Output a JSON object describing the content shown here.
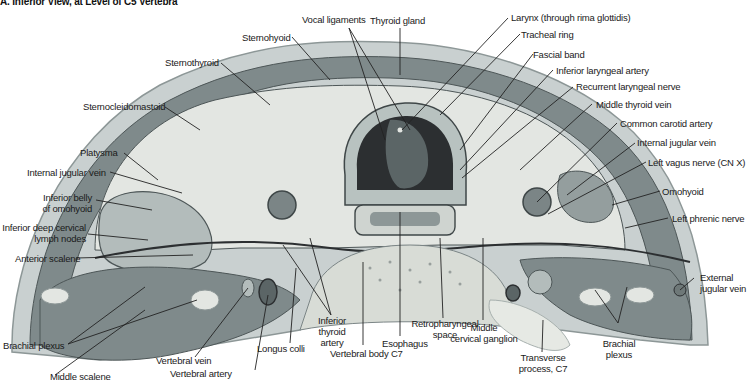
{
  "figure": {
    "title": "A. Inferior View, at Level of C5 Vertebra",
    "colors": {
      "background": "#ffffff",
      "skin": "#c9d0d0",
      "muscle": "#7f8a8b",
      "muscle_dark": "#5b6566",
      "fascia_pale": "#e3e6e2",
      "cartilage": "#b8c2c0",
      "vessel": "#6e7878",
      "bone": "#d8dcd6",
      "airway_dark": "#2c2f31",
      "leader_line": "#222222",
      "label_text": "#1a1a1a"
    },
    "labels": {
      "vocal_ligaments": "Vocal ligaments",
      "thyroid_gland": "Thyroid gland",
      "larynx": "Larynx (through rima glottidis)",
      "tracheal_ring": "Tracheal ring",
      "fascial_band": "Fascial band",
      "inferior_laryngeal_artery": "Inferior laryngeal artery",
      "recurrent_laryngeal_nerve": "Recurrent laryngeal nerve",
      "middle_thyroid_vein": "Middle thyroid vein",
      "common_carotid_artery": "Common carotid artery",
      "internal_jugular_vein_right": "Internal jugular vein",
      "left_vagus_nerve": "Left vagus nerve (CN X)",
      "omohyoid": "Omohyoid",
      "left_phrenic_nerve": "Left phrenic nerve",
      "external_jugular_vein_1": "External",
      "external_jugular_vein_2": "jugular vein",
      "sternohyoid": "Sternohyoid",
      "sternothyroid": "Sternothyroid",
      "sternocleidomastoid": "Sternocleidomastoid",
      "platysma": "Platysma",
      "internal_jugular_vein_left": "Internal jugular vein",
      "inferior_belly_1": "Inferior belly",
      "inferior_belly_2": "of omohyoid",
      "deep_cervical_1": "Inferior deep cervical",
      "deep_cervical_2": "lymph nodes",
      "anterior_scalene": "Anterior scalene",
      "brachial_plexus_left": "Brachial plexus",
      "middle_scalene": "Middle scalene",
      "vertebral_vein": "Vertebral vein",
      "vertebral_artery": "Vertebral artery",
      "longus_colli": "Longus colli",
      "inferior_thyroid_1": "Inferior",
      "inferior_thyroid_2": "thyroid",
      "inferior_thyroid_3": "artery",
      "vertebral_body": "Vertebral body C7",
      "esophagus": "Esophagus",
      "retropharyngeal_1": "Retropharyngeal",
      "retropharyngeal_2": "space",
      "middle_cervical_1": "Middle",
      "middle_cervical_2": "cervical ganglion",
      "transverse_1": "Transverse",
      "transverse_2": "process, C7",
      "brachial_right_1": "Brachial",
      "brachial_right_2": "plexus"
    }
  }
}
